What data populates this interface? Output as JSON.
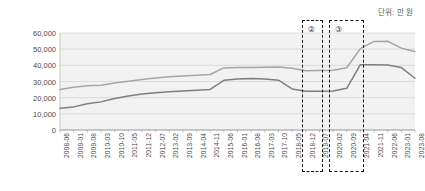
{
  "unit_note": "단위: 만 원",
  "chart_data": {
    "type": "line",
    "title": "",
    "subtitle": "",
    "xlabel": "",
    "ylabel": "",
    "unit": "단위: 만 원",
    "ylim": [
      0,
      60000
    ],
    "ytick_values": [
      0,
      10000,
      20000,
      30000,
      40000,
      50000,
      60000
    ],
    "ytick_labels": [
      "0",
      "10,000",
      "20,000",
      "30,000",
      "40,000",
      "50,000",
      "60,000"
    ],
    "grid": true,
    "legend": "none",
    "xtick_labels": [
      "2008-06",
      "2009-01",
      "2009-08",
      "2010-03",
      "2010-10",
      "2011-05",
      "2011-12",
      "2012-07",
      "2013-02",
      "2013-09",
      "2014-04",
      "2014-11",
      "2015-06",
      "2016-01",
      "2016-08",
      "2017-03",
      "2017-10",
      "2018-05",
      "2018-12",
      "2019-07",
      "2020-02",
      "2020-09",
      "2021-04",
      "2021-11",
      "2022-06",
      "2023-01",
      "2023-08"
    ],
    "x": [
      "2008-06",
      "2009-01",
      "2009-08",
      "2010-03",
      "2010-10",
      "2011-05",
      "2011-12",
      "2012-07",
      "2013-02",
      "2013-09",
      "2014-04",
      "2014-11",
      "2015-06",
      "2016-01",
      "2016-08",
      "2017-03",
      "2017-10",
      "2018-05",
      "2018-12",
      "2019-07",
      "2020-02",
      "2020-09",
      "2021-04",
      "2021-11",
      "2022-06",
      "2023-01",
      "2023-08"
    ],
    "series": [
      {
        "name": "upper-line",
        "color": "#a6a6a6",
        "values": [
          25000,
          26500,
          27300,
          27700,
          29100,
          30200,
          31300,
          32200,
          32900,
          33400,
          33900,
          34300,
          38400,
          38600,
          38700,
          38800,
          38900,
          38200,
          36600,
          36800,
          37000,
          38500,
          50300,
          54800,
          54900,
          50600,
          48500
        ]
      },
      {
        "name": "lower-line",
        "color": "#7f7f7f",
        "values": [
          13500,
          14300,
          16200,
          17400,
          19500,
          21000,
          22300,
          23100,
          23600,
          24100,
          24600,
          25100,
          30700,
          31600,
          31800,
          31500,
          30800,
          25400,
          24000,
          24000,
          24100,
          25800,
          40400,
          40400,
          40200,
          38600,
          32000
        ]
      }
    ],
    "annotations": [
      {
        "label": "②",
        "box_start": "2018-12",
        "box_end": "2019-07"
      },
      {
        "label": "③",
        "box_start": "2020-02",
        "box_end": "2021-04"
      }
    ]
  }
}
